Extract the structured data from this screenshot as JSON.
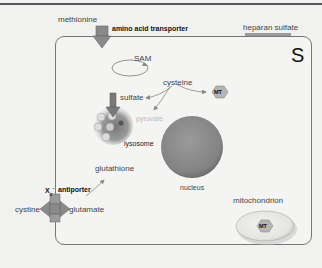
{
  "diagram": {
    "corner_label": "S",
    "labels": {
      "methionine": "methionine",
      "amino_acid_transporter": "amino acid transporter",
      "heparan_sulfate": "heparan sulfate",
      "sam": "SAM",
      "cysteine": "cysteine",
      "sulfate": "sulfate",
      "pyruvate": "pyruvate",
      "lysosome": "lysosome",
      "glutathione": "glutathione",
      "nucleus": "nucleus",
      "mitochondrion": "mitochondrion",
      "antiporter_symbol": "X",
      "antiporter_sub": "c",
      "antiporter_sup": "-",
      "antiporter": "antiporter",
      "cystine": "cystine",
      "glutamate": "glutamate",
      "mt_cytosol": "MT",
      "mt_mito": "MT"
    },
    "colors": {
      "arrow_fill": "#8a8a8a",
      "arrow_stroke": "#666666",
      "nucleus": "#8c8c8c",
      "mt_badge": "#b5b5b5",
      "mito_fill": "#e6e6e2"
    }
  }
}
